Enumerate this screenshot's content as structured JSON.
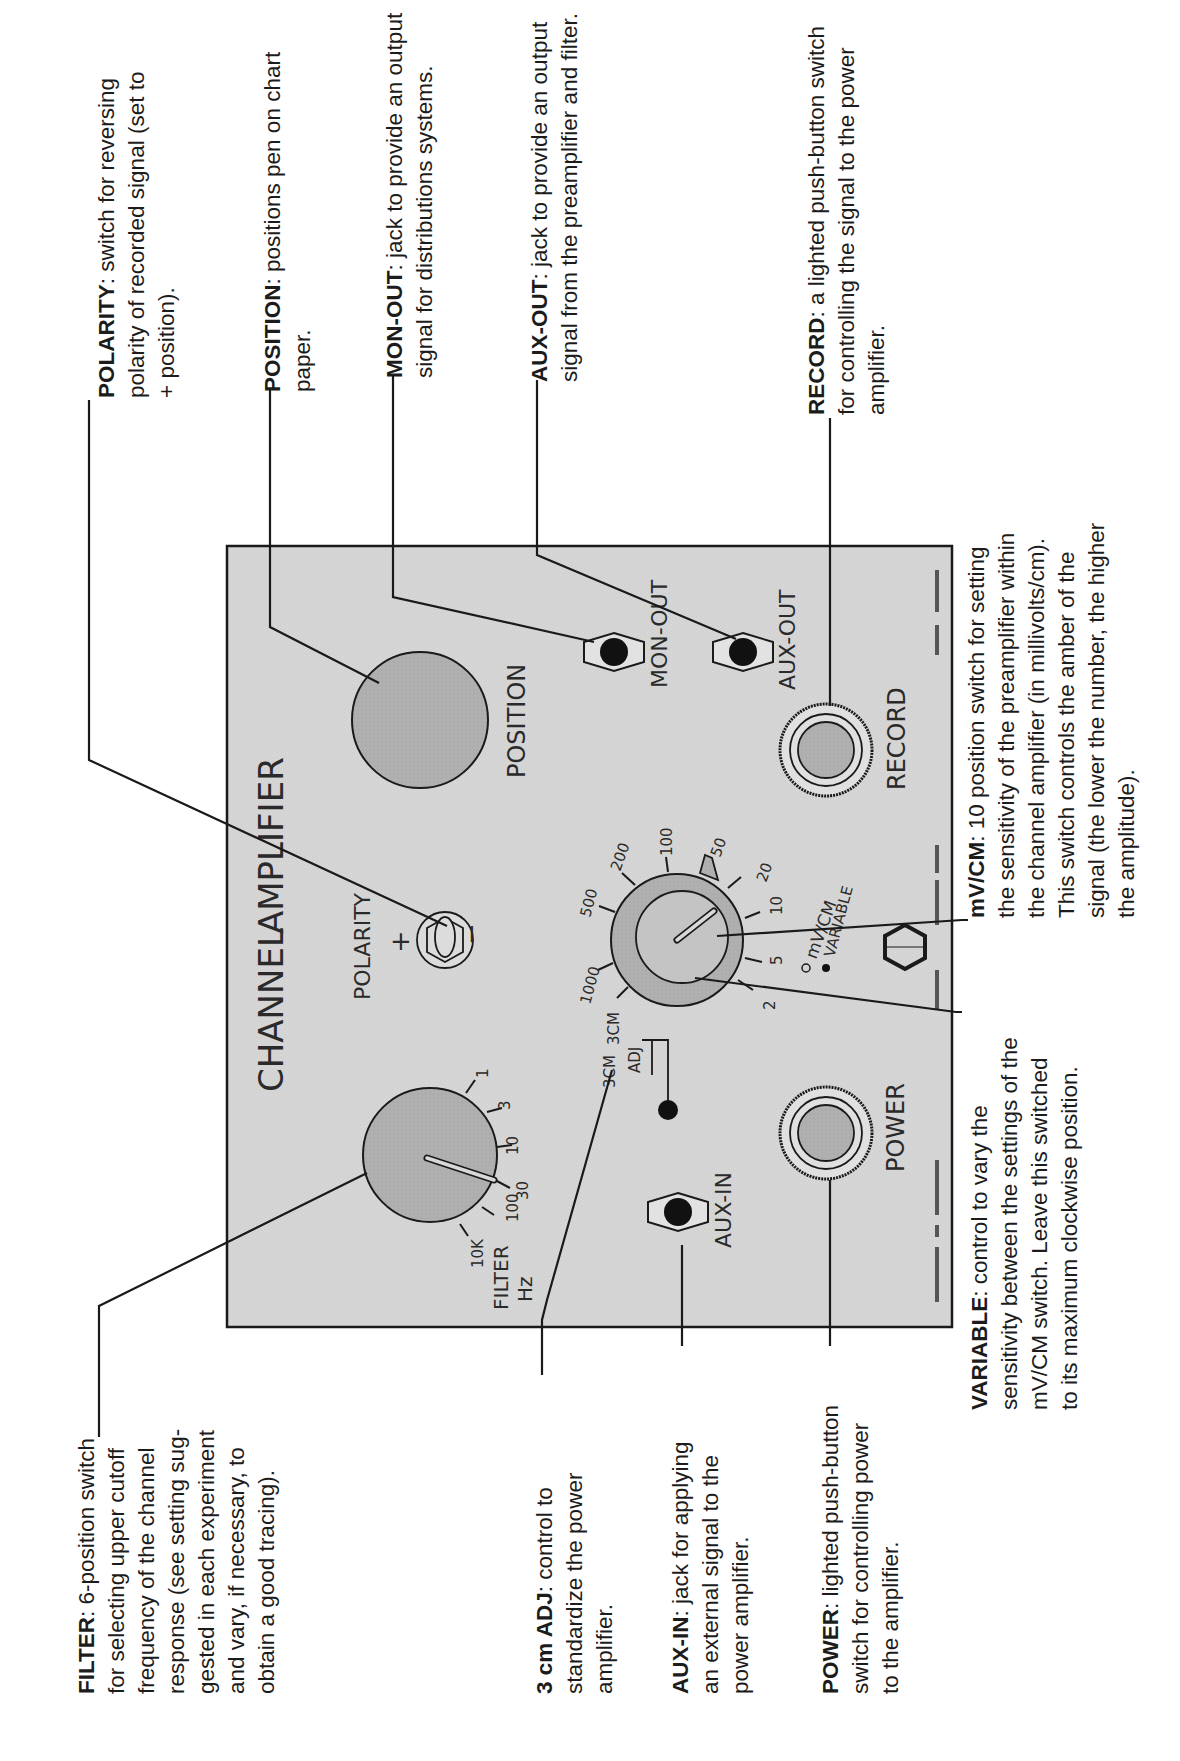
{
  "panel": {
    "title_left": "CHANNEL",
    "title_right": "AMPLIFIER",
    "fill": "#d4d4d4",
    "knob_fill": "#b3b3b3",
    "controls": {
      "position": {
        "label": "POSITION"
      },
      "mon_out": {
        "label": "MON-OUT"
      },
      "aux_out": {
        "label": "AUX-OUT"
      },
      "record": {
        "label": "RECORD"
      },
      "polarity": {
        "label": "POLARITY",
        "plus": "+",
        "minus": "−"
      },
      "mv_cm": {
        "label": "mV/CM",
        "variable_label": "VARIABLE",
        "ticks": [
          "3CM",
          "1000",
          "500",
          "200",
          "100",
          "50",
          "20",
          "10",
          "5",
          "2"
        ]
      },
      "adj": {
        "label_top": "3CM",
        "label_bottom": "ADJ"
      },
      "filter": {
        "label": "FILTER",
        "unit": "Hz",
        "ticks": [
          "10K",
          "100",
          "30",
          "10",
          "3",
          "1"
        ]
      },
      "aux_in": {
        "label": "AUX-IN"
      },
      "power": {
        "label": "POWER"
      }
    }
  },
  "callouts": {
    "polarity": {
      "term": "POLARITY",
      "lines": [
        ": switch for reversing",
        "polarity of recorded signal (set to",
        "+ position)."
      ]
    },
    "position": {
      "term": "POSITION",
      "lines": [
        ": positions pen on chart",
        "paper."
      ]
    },
    "mon_out": {
      "term": "MON-OUT",
      "lines": [
        ": jack to provide an output",
        "signal for distributions systems."
      ]
    },
    "aux_out": {
      "term": "AUX-OUT",
      "lines": [
        ": jack to provide an output",
        "signal from the preamplifier and filter."
      ]
    },
    "record": {
      "term": "RECORD",
      "lines": [
        ": a lighted push-button switch",
        "for controlling the signal to the power",
        "amplifier."
      ]
    },
    "mv_cm": {
      "term": "mV/CM",
      "lines": [
        ": 10 position switch for setting",
        "the sensitivity of the preamplifier within",
        "the channel amplifier (in millivolts/cm).",
        "This switch controls the amber of the",
        "signal (the lower the number, the higher",
        "the amplitude)."
      ]
    },
    "filter": {
      "term": "FILTER",
      "lines": [
        ": 6-position switch",
        "for selecting upper cutoff",
        "frequency of the channel",
        "response (see setting sug-",
        "gested in each experiment",
        "and vary, if necessary, to",
        "obtain a good tracing)."
      ]
    },
    "adj": {
      "term": "3 cm ADJ",
      "lines": [
        ": control to",
        "standardize the power",
        "amplifier."
      ]
    },
    "aux_in": {
      "term": "AUX-IN",
      "lines": [
        ": jack for applying",
        "an external signal to the",
        "power amplifier."
      ]
    },
    "power": {
      "term": "POWER",
      "lines": [
        ": lighted push-button",
        "switch for controlling power",
        "to the amplifier."
      ]
    },
    "variable": {
      "term": "VARIABLE",
      "lines": [
        ": control to vary the",
        "sensitivity between the settings of the",
        "mV/CM switch. Leave this switched",
        "to its maximum clockwise position."
      ]
    }
  }
}
